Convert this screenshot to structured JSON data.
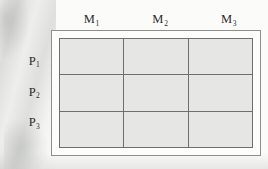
{
  "figure": {
    "type": "matrix-grid",
    "rows": 3,
    "columns": 3,
    "column_headers": [
      {
        "base": "M",
        "subscript": "1"
      },
      {
        "base": "M",
        "subscript": "2"
      },
      {
        "base": "M",
        "subscript": "3"
      }
    ],
    "row_labels": [
      {
        "base": "P",
        "subscript": "1"
      },
      {
        "base": "P",
        "subscript": "2"
      },
      {
        "base": "P",
        "subscript": "3"
      }
    ],
    "cells": [
      [
        "",
        "",
        ""
      ],
      [
        "",
        "",
        ""
      ],
      [
        "",
        "",
        ""
      ]
    ],
    "colors": {
      "cell_fill": "#e6e6e4",
      "grid_line": "#6e7070",
      "outer_frame": "#8e8f8d",
      "background": "#fbfbfa",
      "text": "#2b2b2b"
    }
  },
  "chart_data": {
    "type": "table",
    "title": "",
    "columns": [
      "M1",
      "M2",
      "M3"
    ],
    "rows": [
      "P1",
      "P2",
      "P3"
    ],
    "values": [
      [
        "",
        "",
        ""
      ],
      [
        "",
        "",
        ""
      ],
      [
        "",
        "",
        ""
      ]
    ],
    "grid": true,
    "legend": "none"
  }
}
